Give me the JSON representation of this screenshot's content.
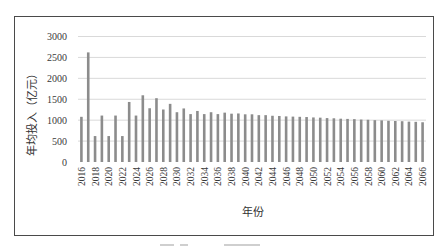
{
  "chart_data": {
    "type": "bar",
    "title": "",
    "xlabel": "年份",
    "ylabel": "年均投入（亿元）",
    "ylim": [
      0,
      3000
    ],
    "yticks": [
      0,
      500,
      1000,
      1500,
      2000,
      2500,
      3000
    ],
    "grid": true,
    "legend": null,
    "bar_color": "#8c8c8c",
    "grid_color": "#d9d9d9",
    "categories": [
      2016,
      2017,
      2018,
      2019,
      2020,
      2021,
      2022,
      2023,
      2024,
      2025,
      2026,
      2027,
      2028,
      2029,
      2030,
      2031,
      2032,
      2033,
      2034,
      2035,
      2036,
      2037,
      2038,
      2039,
      2040,
      2041,
      2042,
      2043,
      2044,
      2045,
      2046,
      2047,
      2048,
      2049,
      2050,
      2051,
      2052,
      2053,
      2054,
      2055,
      2056,
      2057,
      2058,
      2059,
      2060,
      2061,
      2062,
      2063,
      2064,
      2065,
      2066
    ],
    "xtick_labels": [
      "2016",
      "2018",
      "2020",
      "2022",
      "2024",
      "2026",
      "2028",
      "2030",
      "2032",
      "2034",
      "2036",
      "2038",
      "2040",
      "2042",
      "2044",
      "2046",
      "2048",
      "2050",
      "2052",
      "2054",
      "2056",
      "2058",
      "2060",
      "2062",
      "2064",
      "2066"
    ],
    "values": [
      1080,
      2620,
      620,
      1110,
      620,
      1110,
      620,
      1435,
      1110,
      1595,
      1285,
      1525,
      1255,
      1390,
      1190,
      1280,
      1145,
      1220,
      1145,
      1190,
      1145,
      1180,
      1155,
      1160,
      1140,
      1140,
      1120,
      1120,
      1105,
      1100,
      1090,
      1085,
      1080,
      1075,
      1065,
      1060,
      1050,
      1045,
      1035,
      1030,
      1025,
      1015,
      1010,
      1000,
      995,
      985,
      980,
      975,
      965,
      960,
      950
    ]
  },
  "caption": ""
}
